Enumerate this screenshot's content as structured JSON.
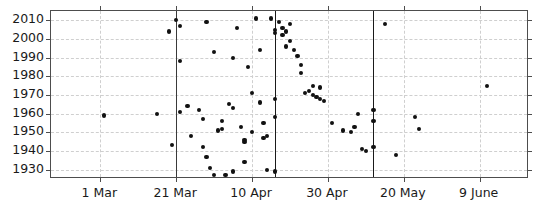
{
  "chart_data": {
    "type": "scatter",
    "title": "",
    "xlabel": "",
    "ylabel": "",
    "grid": true,
    "legend": null,
    "y_axis": {
      "ticks": [
        1930,
        1940,
        1950,
        1960,
        1970,
        1980,
        1990,
        2000,
        2010
      ],
      "ylim": [
        1925,
        2015
      ]
    },
    "x_axis": {
      "tick_labels": [
        "1 Mar",
        "21 Mar",
        "10 Apr",
        "30 Apr",
        "20 May",
        "9 June"
      ],
      "tick_days": [
        60,
        80,
        100,
        120,
        140,
        160
      ],
      "xlim_days": [
        47,
        173
      ],
      "unit": "day of year"
    },
    "reference_lines": [
      {
        "name": "ref-line-1",
        "day": 80
      },
      {
        "name": "ref-line-2",
        "day": 106
      },
      {
        "name": "ref-line-3",
        "day": 132
      }
    ],
    "series": [
      {
        "name": "bloom-dates",
        "marker": "circle",
        "color": "#111111",
        "points": [
          {
            "day": 61,
            "year": 1959
          },
          {
            "day": 75,
            "year": 1960
          },
          {
            "day": 78,
            "year": 2004
          },
          {
            "day": 87,
            "year": 1957
          },
          {
            "day": 95,
            "year": 1963
          },
          {
            "day": 100,
            "year": 1971
          },
          {
            "day": 101,
            "year": 2011
          },
          {
            "day": 102,
            "year": 1994
          },
          {
            "day": 79,
            "year": 1943
          },
          {
            "day": 80,
            "year": 2010
          },
          {
            "day": 81,
            "year": 2007
          },
          {
            "day": 81,
            "year": 1988
          },
          {
            "day": 81,
            "year": 1961
          },
          {
            "day": 83,
            "year": 1964
          },
          {
            "day": 84,
            "year": 1948
          },
          {
            "day": 86,
            "year": 1962
          },
          {
            "day": 87,
            "year": 1942
          },
          {
            "day": 88,
            "year": 2009
          },
          {
            "day": 88,
            "year": 1937
          },
          {
            "day": 89,
            "year": 1931
          },
          {
            "day": 90,
            "year": 1927
          },
          {
            "day": 90,
            "year": 1993
          },
          {
            "day": 91,
            "year": 1951
          },
          {
            "day": 92,
            "year": 1956
          },
          {
            "day": 92,
            "year": 1952
          },
          {
            "day": 93,
            "year": 1927
          },
          {
            "day": 94,
            "year": 1965
          },
          {
            "day": 95,
            "year": 1990
          },
          {
            "day": 95,
            "year": 1929
          },
          {
            "day": 96,
            "year": 2006
          },
          {
            "day": 97,
            "year": 1953
          },
          {
            "day": 98,
            "year": 1946
          },
          {
            "day": 98,
            "year": 1945
          },
          {
            "day": 98,
            "year": 1934
          },
          {
            "day": 99,
            "year": 1985
          },
          {
            "day": 100,
            "year": 1950
          },
          {
            "day": 102,
            "year": 1966
          },
          {
            "day": 103,
            "year": 1955
          },
          {
            "day": 103,
            "year": 1947
          },
          {
            "day": 104,
            "year": 1948
          },
          {
            "day": 104,
            "year": 1930
          },
          {
            "day": 105,
            "year": 2011
          },
          {
            "day": 106,
            "year": 2005
          },
          {
            "day": 106,
            "year": 2003
          },
          {
            "day": 106,
            "year": 1968
          },
          {
            "day": 106,
            "year": 1958
          },
          {
            "day": 106,
            "year": 1929
          },
          {
            "day": 107,
            "year": 2009
          },
          {
            "day": 108,
            "year": 2006
          },
          {
            "day": 108,
            "year": 2002
          },
          {
            "day": 109,
            "year": 2004
          },
          {
            "day": 109,
            "year": 1996
          },
          {
            "day": 110,
            "year": 2008
          },
          {
            "day": 110,
            "year": 1999
          },
          {
            "day": 111,
            "year": 1994
          },
          {
            "day": 112,
            "year": 1991
          },
          {
            "day": 113,
            "year": 1986
          },
          {
            "day": 114,
            "year": 1971
          },
          {
            "day": 115,
            "year": 1972
          },
          {
            "day": 116,
            "year": 1970
          },
          {
            "day": 117,
            "year": 1969
          },
          {
            "day": 118,
            "year": 1968
          },
          {
            "day": 119,
            "year": 1967
          },
          {
            "day": 113,
            "year": 1982
          },
          {
            "day": 116,
            "year": 1975
          },
          {
            "day": 118,
            "year": 1974
          },
          {
            "day": 121,
            "year": 1955
          },
          {
            "day": 124,
            "year": 1951
          },
          {
            "day": 126,
            "year": 1950
          },
          {
            "day": 127,
            "year": 1953
          },
          {
            "day": 129,
            "year": 1941
          },
          {
            "day": 130,
            "year": 1940
          },
          {
            "day": 128,
            "year": 1960
          },
          {
            "day": 132,
            "year": 1962
          },
          {
            "day": 132,
            "year": 1956
          },
          {
            "day": 132,
            "year": 1942
          },
          {
            "day": 135,
            "year": 2008
          },
          {
            "day": 138,
            "year": 1938
          },
          {
            "day": 143,
            "year": 1958
          },
          {
            "day": 144,
            "year": 1952
          },
          {
            "day": 162,
            "year": 1975
          }
        ]
      }
    ]
  }
}
